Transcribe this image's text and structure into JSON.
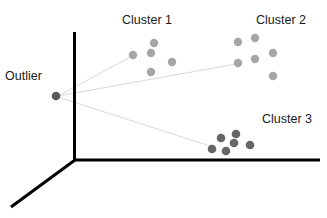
{
  "diagram": {
    "labels": {
      "outlier": "Outlier",
      "cluster1": "Cluster 1",
      "cluster2": "Cluster 2",
      "cluster3": "Cluster 3"
    },
    "colors": {
      "axis": "#000000",
      "outlier_point": "#595959",
      "cluster_light": "#a6a6a6",
      "cluster_dark": "#666666",
      "link_line": "#d9d9d9",
      "text": "#1a1a1a"
    },
    "axes": [
      "vertical-axis",
      "horizontal-axis",
      "depth-axis"
    ],
    "nodes": [
      {
        "id": "outlier",
        "label_key": "outlier",
        "point_count": 1,
        "shade": "dark"
      },
      {
        "id": "cluster1",
        "label_key": "cluster1",
        "point_count": 5,
        "shade": "light"
      },
      {
        "id": "cluster2",
        "label_key": "cluster2",
        "point_count": 6,
        "shade": "light"
      },
      {
        "id": "cluster3",
        "label_key": "cluster3",
        "point_count": 6,
        "shade": "dark"
      }
    ],
    "edges": [
      {
        "from": "outlier",
        "to": "cluster1"
      },
      {
        "from": "outlier",
        "to": "cluster2"
      },
      {
        "from": "outlier",
        "to": "cluster3"
      }
    ]
  }
}
